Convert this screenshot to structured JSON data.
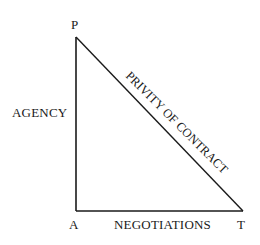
{
  "diagram": {
    "type": "triangle",
    "vertices": {
      "top": "P",
      "bottom_left": "A",
      "bottom_right": "T"
    },
    "edges": {
      "left": "AGENCY",
      "bottom": "NEGOTIATIONS",
      "hypotenuse": "PRIVITY OF CONTRACT"
    },
    "line_color": "#1a1a1a"
  }
}
